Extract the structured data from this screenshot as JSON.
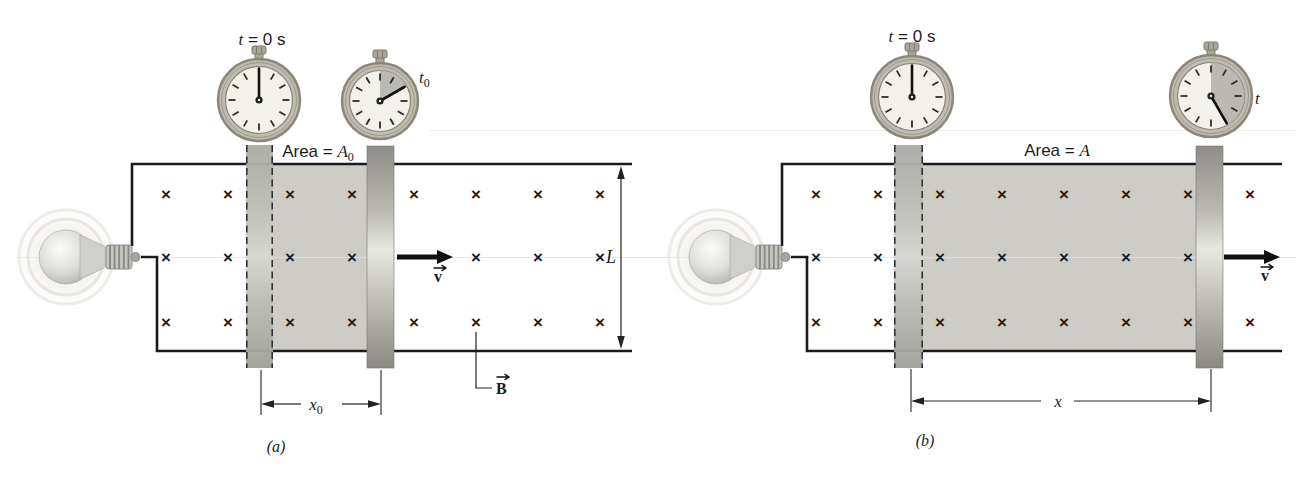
{
  "figure": {
    "type": "physics-textbook-diagram",
    "field_symbol": "×",
    "colors": {
      "background": "#ffffff",
      "shade": "#cdccc6",
      "line": "#1a1a1a",
      "cross": "#4a4a4a",
      "watch-bezel": "#c0bcb1",
      "watch-bezel-edge": "#8b877c",
      "watch-face": "#f2f1ea",
      "wedge": "#b6b6b0",
      "dim": "#222222",
      "glow": "#e7e3de"
    },
    "panels": [
      {
        "id": "a",
        "caption": "(a)",
        "stopwatch_start": {
          "label_var": "t",
          "label_rest": " = 0 s",
          "hand_angle_deg": 0,
          "wedge_deg": 0
        },
        "stopwatch_now": {
          "label_var": "t",
          "label_sub": "0",
          "hand_angle_deg": 60,
          "wedge_deg": 60
        },
        "area_label": {
          "prefix": "Area = ",
          "symbol": "A",
          "sub": "0"
        },
        "width_label": {
          "symbol": "x",
          "sub": "0"
        },
        "length_label": "L",
        "field_label": "B",
        "velocity_label": "v"
      },
      {
        "id": "b",
        "caption": "(b)",
        "stopwatch_start": {
          "label_var": "t",
          "label_rest": " = 0 s",
          "hand_angle_deg": 0,
          "wedge_deg": 0
        },
        "stopwatch_now": {
          "label_var": "t",
          "label_sub": "",
          "hand_angle_deg": 150,
          "wedge_deg": 150
        },
        "area_label": {
          "prefix": "Area = ",
          "symbol": "A",
          "sub": ""
        },
        "width_label": {
          "symbol": "x",
          "sub": ""
        },
        "velocity_label": "v"
      }
    ]
  }
}
